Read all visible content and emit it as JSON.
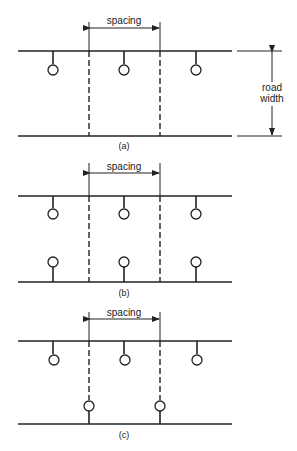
{
  "figure": {
    "panels": [
      {
        "id": "a",
        "caption": "(a)",
        "dimension_label": "spacing",
        "road_width_label_line1": "road",
        "road_width_label_line2": "width"
      },
      {
        "id": "b",
        "caption": "(b)",
        "dimension_label": "spacing"
      },
      {
        "id": "c",
        "caption": "(c)",
        "dimension_label": "spacing"
      }
    ],
    "colors": {
      "ink": "#222222",
      "background": "#ffffff"
    }
  }
}
